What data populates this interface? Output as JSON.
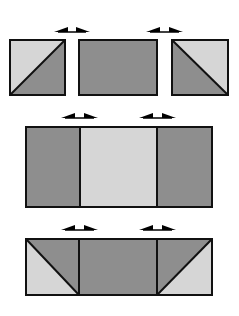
{
  "colors": {
    "dark": "#8e8e8e",
    "light": "#d6d6d6",
    "stroke": "#111111",
    "background": "#ffffff"
  },
  "rows": [
    {
      "name": "row-1-separate-pieces",
      "pieces": [
        {
          "type": "half-square-triangle",
          "x": 10,
          "y": 40,
          "w": 55,
          "h": 55,
          "diagonal": "bottom-left-to-top-right",
          "upper": "light",
          "lower": "dark"
        },
        {
          "type": "rectangle",
          "x": 79,
          "y": 40,
          "w": 78,
          "h": 55,
          "fill": "dark"
        },
        {
          "type": "half-square-triangle",
          "x": 172,
          "y": 40,
          "w": 56,
          "h": 55,
          "diagonal": "top-left-to-bottom-right",
          "upper": "light",
          "lower": "dark"
        }
      ],
      "arrows": [
        {
          "x1": 54,
          "x2": 90,
          "y": 32
        },
        {
          "x1": 146,
          "x2": 183,
          "y": 32
        }
      ]
    },
    {
      "name": "row-2-joined-strips",
      "pieces": [
        {
          "type": "rectangle",
          "x": 26,
          "y": 127,
          "w": 54,
          "h": 80,
          "fill": "dark"
        },
        {
          "type": "rectangle",
          "x": 80,
          "y": 127,
          "w": 77,
          "h": 80,
          "fill": "light"
        },
        {
          "type": "rectangle",
          "x": 157,
          "y": 127,
          "w": 55,
          "h": 80,
          "fill": "dark"
        }
      ],
      "arrows": [
        {
          "x1": 61,
          "x2": 98,
          "y": 118
        },
        {
          "x1": 139,
          "x2": 176,
          "y": 118
        }
      ]
    },
    {
      "name": "row-3-joined-with-triangles",
      "pieces": [
        {
          "type": "half-square-triangle",
          "x": 26,
          "y": 239,
          "w": 53,
          "h": 56,
          "diagonal": "top-left-to-bottom-right",
          "upper": "dark",
          "lower": "light"
        },
        {
          "type": "rectangle",
          "x": 79,
          "y": 239,
          "w": 78,
          "h": 56,
          "fill": "dark"
        },
        {
          "type": "half-square-triangle",
          "x": 157,
          "y": 239,
          "w": 55,
          "h": 56,
          "diagonal": "bottom-left-to-top-right",
          "upper": "dark",
          "lower": "light"
        }
      ],
      "arrows": [
        {
          "x1": 61,
          "x2": 98,
          "y": 230
        },
        {
          "x1": 139,
          "x2": 176,
          "y": 230
        }
      ]
    }
  ]
}
